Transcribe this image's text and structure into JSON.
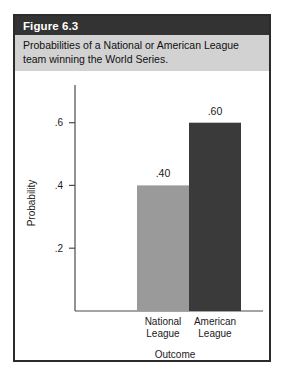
{
  "figure": {
    "label": "Figure 6.3",
    "caption": "Probabilities of a National or American League team winning the World Series."
  },
  "colors": {
    "title_band": "#333333",
    "subtitle_band": "#d2d2d2",
    "card_border": "#2b2b2b",
    "bar_national": "#9a9a9a",
    "bar_american": "#3a3a3a",
    "axis": "#4a4a4a",
    "text": "#1a1a1a"
  },
  "chart_data": {
    "type": "bar",
    "title": "",
    "categories": [
      "National League",
      "American League"
    ],
    "category_lines": [
      [
        "National",
        "League"
      ],
      [
        "American",
        "League"
      ]
    ],
    "values": [
      0.4,
      0.6
    ],
    "value_labels": [
      ".40",
      ".60"
    ],
    "series": [
      {
        "name": "Probability",
        "values": [
          0.4,
          0.6
        ],
        "colors": [
          "#9a9a9a",
          "#3a3a3a"
        ]
      }
    ],
    "xlabel": "Outcome",
    "ylabel": "Probability",
    "ylim": [
      0,
      0.72
    ],
    "yticks": [
      0.2,
      0.4,
      0.6
    ],
    "ytick_labels": [
      ".2",
      ".4",
      ".6"
    ],
    "grid": false,
    "legend": false
  }
}
